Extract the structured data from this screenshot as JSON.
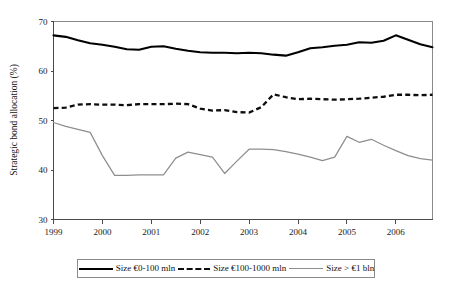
{
  "chart_data": {
    "type": "line",
    "title": "",
    "xlabel": "",
    "ylabel": "Strategic bond allocation (%)",
    "xlim": [
      1999.0,
      2006.75
    ],
    "ylim": [
      30,
      70
    ],
    "yticks": [
      30,
      40,
      50,
      60,
      70
    ],
    "xticks": [
      1999,
      2000,
      2001,
      2002,
      2003,
      2004,
      2005,
      2006
    ],
    "xtick_labels": [
      "1999",
      "2000",
      "2001",
      "2002",
      "2003",
      "2004",
      "2005",
      "2006"
    ],
    "ytick_labels": [
      "30",
      "40",
      "50",
      "60",
      "70"
    ],
    "grid": false,
    "legend_position": "below",
    "x": [
      1999.0,
      1999.25,
      1999.5,
      1999.75,
      2000.0,
      2000.25,
      2000.5,
      2000.75,
      2001.0,
      2001.25,
      2001.5,
      2001.75,
      2002.0,
      2002.25,
      2002.5,
      2002.75,
      2003.0,
      2003.25,
      2003.5,
      2003.75,
      2004.0,
      2004.25,
      2004.5,
      2004.75,
      2005.0,
      2005.25,
      2005.5,
      2005.75,
      2006.0,
      2006.25,
      2006.5,
      2006.75
    ],
    "series": [
      {
        "name": "Size €0-100 mln",
        "style": "solid-black",
        "color": "#000000",
        "values": [
          67.2,
          66.9,
          66.2,
          65.6,
          65.3,
          64.9,
          64.4,
          64.3,
          64.9,
          65.0,
          64.5,
          64.1,
          63.8,
          63.7,
          63.7,
          63.6,
          63.7,
          63.6,
          63.3,
          63.1,
          63.8,
          64.6,
          64.8,
          65.1,
          65.3,
          65.8,
          65.7,
          66.1,
          67.2,
          66.3,
          65.4,
          64.8
        ]
      },
      {
        "name": "Size €100-1000 mln",
        "style": "dashed-black",
        "color": "#0d0d0d",
        "values": [
          52.5,
          52.6,
          53.2,
          53.3,
          53.2,
          53.2,
          53.1,
          53.3,
          53.3,
          53.3,
          53.4,
          53.3,
          52.4,
          52.0,
          52.1,
          51.7,
          51.6,
          52.7,
          55.3,
          54.7,
          54.3,
          54.4,
          54.3,
          54.2,
          54.3,
          54.4,
          54.6,
          54.8,
          55.2,
          55.2,
          55.1,
          55.2
        ]
      },
      {
        "name": "Size > €1 bln",
        "style": "solid-gray",
        "color": "#8e8e8e",
        "values": [
          49.6,
          48.8,
          48.2,
          47.6,
          42.9,
          38.9,
          38.9,
          39.0,
          39.0,
          39.0,
          42.4,
          43.6,
          43.1,
          42.6,
          39.3,
          41.8,
          44.2,
          44.2,
          44.1,
          43.7,
          43.2,
          42.6,
          41.9,
          42.6,
          46.8,
          45.6,
          46.2,
          45.0,
          43.9,
          42.9,
          42.3,
          42.0
        ]
      }
    ],
    "legend_entries": [
      {
        "label": "Size €0-100 mln",
        "style": "solid-black"
      },
      {
        "label": "Size €100-1000 mln",
        "style": "dashed-black"
      },
      {
        "label": "Size > €1 bln",
        "style": "solid-gray"
      }
    ]
  }
}
